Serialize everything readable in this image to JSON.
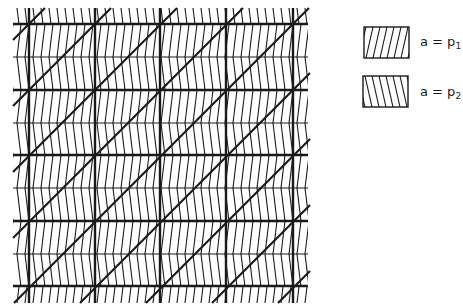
{
  "diagram": {
    "kind": "lattice-tiling",
    "colors": {
      "line": "#1a1a1a",
      "background": "#ffffff"
    },
    "grid": {
      "left": 13,
      "right": 308,
      "top": 8,
      "bottom": 303,
      "heavy_vertical_x": [
        29,
        95,
        160,
        226,
        293
      ],
      "heavy_horizontal_y": [
        24,
        90,
        155,
        221,
        286
      ],
      "thin_horizontal_y": [
        57,
        123,
        188,
        254
      ],
      "cell_size": 66,
      "hatch_spacing": 8,
      "heavy_diagonal": "lower-left to upper-right, slope 1 through each heavy cell"
    },
    "regions": [
      {
        "name": "upper-half-band",
        "hatch": "forward-slash",
        "value_label": "p1"
      },
      {
        "name": "lower-half-band",
        "hatch": "back-slash",
        "value_label": "p2"
      }
    ]
  },
  "legend": {
    "items": [
      {
        "hatch": "forward-slash",
        "label_prefix": "a = p",
        "label_sub": "1",
        "box": {
          "x": 364,
          "y": 27,
          "w": 45,
          "h": 31
        },
        "label_pos": {
          "x": 420,
          "y": 34
        }
      },
      {
        "hatch": "back-slash",
        "label_prefix": "a = p",
        "label_sub": "2",
        "box": {
          "x": 363,
          "y": 76,
          "w": 45,
          "h": 31
        },
        "label_pos": {
          "x": 420,
          "y": 84
        }
      }
    ]
  }
}
